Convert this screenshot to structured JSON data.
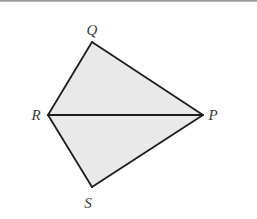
{
  "diagram": {
    "type": "kite-quadrilateral",
    "colors": {
      "fill": "#e9e9e9",
      "stroke": "#1e1e1e",
      "label": "#3a3a3a",
      "top_rule": "#9a9a9a"
    },
    "vertices": {
      "Q": {
        "label": "Q",
        "x": 92,
        "y": 42,
        "label_x": 92,
        "label_y": 35
      },
      "R": {
        "label": "R",
        "x": 48,
        "y": 115,
        "label_x": 36,
        "label_y": 120
      },
      "P": {
        "label": "P",
        "x": 203,
        "y": 115,
        "label_x": 213,
        "label_y": 120
      },
      "S": {
        "label": "S",
        "x": 92,
        "y": 187,
        "label_x": 88,
        "label_y": 208
      }
    },
    "segments": [
      "QR",
      "QP",
      "RP",
      "RS",
      "SP"
    ],
    "triangles": [
      "QRP",
      "RSP"
    ]
  }
}
